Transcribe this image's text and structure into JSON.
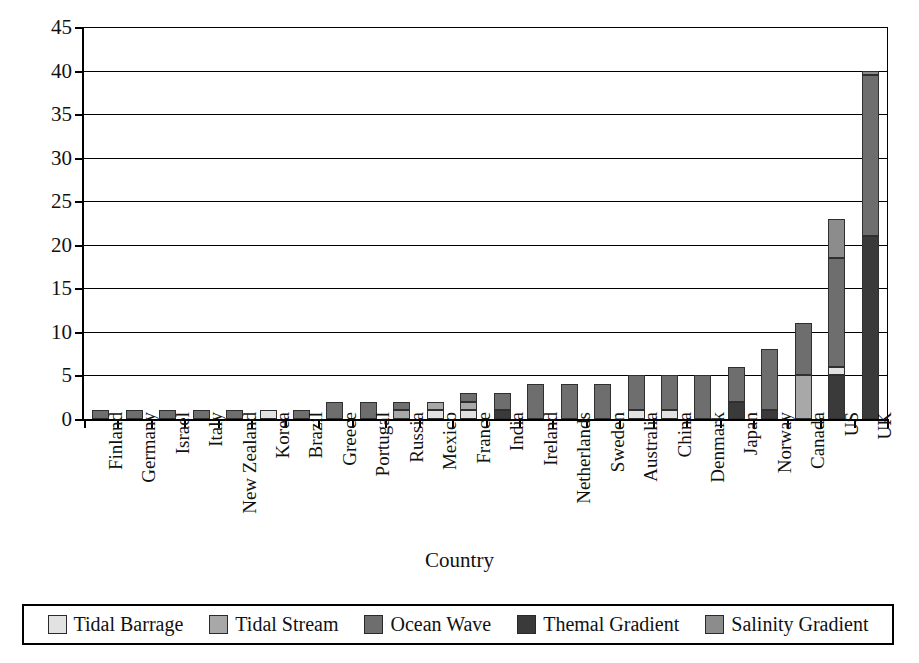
{
  "chart_data": {
    "type": "bar",
    "stacked": true,
    "title": "",
    "xlabel": "Country",
    "ylabel": "Number of systems",
    "ylim": [
      0,
      45
    ],
    "ytick_step": 5,
    "yticks": [
      0,
      5,
      10,
      15,
      20,
      25,
      30,
      35,
      40,
      45
    ],
    "grid": true,
    "legend_position": "bottom",
    "categories": [
      "Finland",
      "Germany",
      "Israel",
      "Italy",
      "New Zealand",
      "Korea",
      "Brazil",
      "Greece",
      "Portugal",
      "Russia",
      "Mexico",
      "France",
      "India",
      "Ireland",
      "Netherlands",
      "Sweden",
      "Australia",
      "China",
      "Denmark",
      "Japan",
      "Norway",
      "Canada",
      "US",
      "UK"
    ],
    "series": [
      {
        "name": "Tidal Barrage",
        "color": "#e2e2e2",
        "values": [
          0,
          0,
          0,
          0,
          0,
          1,
          0,
          0,
          0,
          0,
          1,
          1,
          0,
          0,
          0,
          0,
          1,
          1,
          0,
          0,
          0,
          0,
          1,
          0
        ]
      },
      {
        "name": "Tidal Stream",
        "color": "#a8a8a8",
        "values": [
          0,
          0,
          0,
          0,
          0,
          0,
          0,
          0,
          0,
          1,
          1,
          1,
          0,
          0,
          0,
          0,
          0,
          0,
          0,
          0,
          0,
          5,
          0,
          0
        ]
      },
      {
        "name": "Ocean Wave",
        "color": "#6e6e6e",
        "values": [
          1,
          1,
          1,
          1,
          1,
          0,
          1,
          2,
          2,
          1,
          0,
          1,
          2,
          4,
          4,
          4,
          4,
          4,
          5,
          4,
          7,
          6,
          12.5,
          18.5
        ]
      },
      {
        "name": "Themal Gradient",
        "color": "#3a3a3a",
        "values": [
          0,
          0,
          0,
          0,
          0,
          0,
          0,
          0,
          0,
          0,
          0,
          0,
          1,
          0,
          0,
          0,
          0,
          0,
          0,
          2,
          1,
          0,
          5,
          21
        ]
      },
      {
        "name": "Salinity Gradient",
        "color": "#8c8c8c",
        "values": [
          0,
          0,
          0,
          0,
          0,
          0,
          0,
          0,
          0,
          0,
          0,
          0,
          0,
          0,
          0,
          0,
          0,
          0,
          0,
          0,
          0,
          0,
          4.5,
          0.5
        ]
      }
    ],
    "totals": [
      1,
      1,
      1,
      1,
      1,
      1,
      1,
      2,
      2,
      2,
      2,
      3,
      3,
      4,
      4,
      4,
      5,
      5,
      5,
      6,
      8,
      11,
      23,
      40
    ],
    "stack_order": [
      "Themal Gradient",
      "Tidal Barrage",
      "Tidal Stream",
      "Ocean Wave",
      "Salinity Gradient"
    ]
  },
  "axes": {
    "y_title": "Number of systems",
    "x_title": "Country",
    "y_tick_labels": [
      "45",
      "40",
      "35",
      "30",
      "25",
      "20",
      "15",
      "10",
      "5",
      "0"
    ]
  },
  "legend": {
    "items": [
      {
        "label": "Tidal Barrage",
        "color": "#e2e2e2"
      },
      {
        "label": "Tidal Stream",
        "color": "#a8a8a8"
      },
      {
        "label": "Ocean Wave",
        "color": "#6e6e6e"
      },
      {
        "label": "Themal Gradient",
        "color": "#3a3a3a"
      },
      {
        "label": "Salinity Gradient",
        "color": "#8c8c8c"
      }
    ]
  }
}
